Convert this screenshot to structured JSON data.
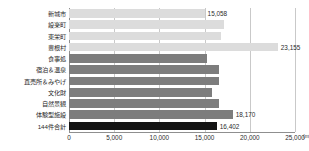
{
  "chart_data": {
    "type": "bar",
    "orientation": "horizontal",
    "title": "",
    "xlabel": "",
    "ylabel": "",
    "unit": "(m)",
    "xlim": [
      0,
      25000
    ],
    "grid": true,
    "legend": null,
    "tick_labels": [
      "0",
      "5,000",
      "10,000",
      "15,000",
      "20,000",
      "25,000"
    ],
    "ticks": [
      0,
      5000,
      10000,
      15000,
      20000,
      25000
    ],
    "categories": [
      "新城市",
      "設楽町",
      "東栄町",
      "豊根村",
      "食事処",
      "宿泊＆温泉",
      "直売所＆みやげ",
      "文化財",
      "自然景観",
      "体験型施設",
      "144件合計"
    ],
    "values": [
      15058,
      17100,
      16800,
      23155,
      15300,
      16600,
      16600,
      15800,
      16600,
      18170,
      16402
    ],
    "value_labels": [
      "15,058",
      "",
      "",
      "23,155",
      "",
      "",
      "",
      "",
      "",
      "18,170",
      "16,402"
    ],
    "groups": [
      "light",
      "light",
      "light",
      "light",
      "mid",
      "mid",
      "mid",
      "mid",
      "mid",
      "mid",
      "dark"
    ],
    "colors": {
      "light": "#dcdcdc",
      "mid": "#7d7d7d",
      "dark": "#141414",
      "gridline": "#c9c9c9",
      "axis": "#8f8f8f",
      "text": "#2b2b2b",
      "background": "#ffffff"
    }
  }
}
